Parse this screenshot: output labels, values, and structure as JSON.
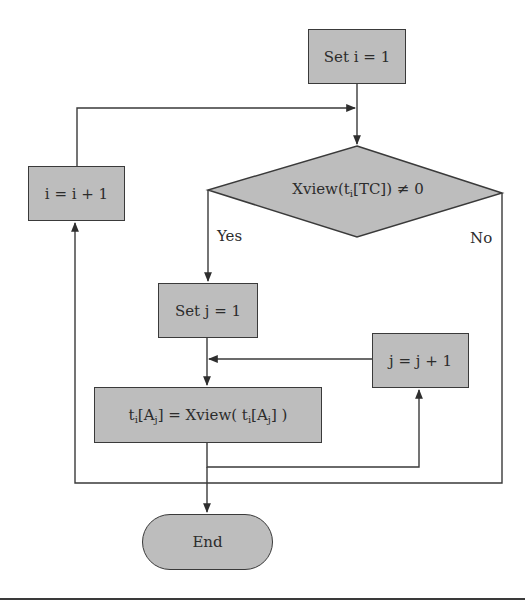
{
  "diagram": {
    "type": "flowchart",
    "nodes": {
      "set_i": {
        "label": "Set i = 1",
        "shape": "process"
      },
      "decision": {
        "label_prefix": "Xview(t",
        "label_sub": "i",
        "label_suffix": "[TC]) ≠ 0",
        "shape": "decision"
      },
      "inc_i": {
        "label": "i = i + 1",
        "shape": "process"
      },
      "set_j": {
        "label": "Set j = 1",
        "shape": "process"
      },
      "inc_j": {
        "label": "j = j + 1",
        "shape": "process"
      },
      "assign": {
        "p1": "t",
        "s1": "i",
        "p2": "[A",
        "s2": "j",
        "p3": "] = Xview( t",
        "s3": "i",
        "p4": "[A",
        "s4": "j",
        "p5": "] )",
        "shape": "process"
      },
      "end": {
        "label": "End",
        "shape": "terminal"
      }
    },
    "edge_labels": {
      "yes": "Yes",
      "no": "No"
    },
    "edges": [
      {
        "from": "set_i",
        "to": "decision"
      },
      {
        "from": "decision",
        "to": "set_j",
        "label": "Yes"
      },
      {
        "from": "decision",
        "to": "end",
        "label": "No"
      },
      {
        "from": "set_j",
        "to": "assign"
      },
      {
        "from": "assign",
        "to": "inc_j"
      },
      {
        "from": "inc_j",
        "to": "assign"
      },
      {
        "from": "assign",
        "to": "end"
      },
      {
        "from": "loop_back",
        "to": "inc_i"
      },
      {
        "from": "inc_i",
        "to": "decision"
      }
    ],
    "colors": {
      "fill": "#bdbdbd",
      "stroke": "#3a3a3a",
      "background": "#ffffff"
    }
  }
}
